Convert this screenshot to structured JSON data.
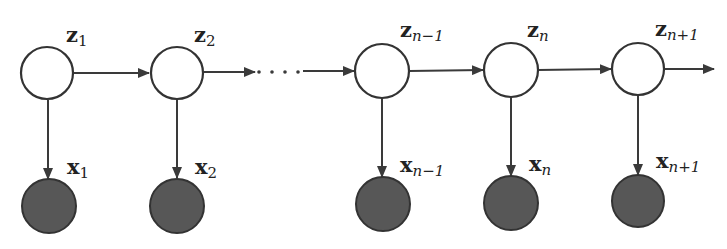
{
  "diagram": {
    "type": "hidden-markov-model",
    "colors": {
      "latent_fill": "#ffffff",
      "observed_fill": "#575757",
      "stroke": "#333333"
    },
    "latent_nodes": [
      {
        "id": "z1",
        "base": "z",
        "sub": "1",
        "cx": 47,
        "cy": 73
      },
      {
        "id": "z2",
        "base": "z",
        "sub": "2",
        "cx": 177,
        "cy": 73
      },
      {
        "id": "zn-1",
        "base": "z",
        "sub": "n−1",
        "cx": 382,
        "cy": 71
      },
      {
        "id": "zn",
        "base": "z",
        "sub": "n",
        "cx": 511,
        "cy": 70
      },
      {
        "id": "zn+1",
        "base": "z",
        "sub": "n+1",
        "cx": 638,
        "cy": 69
      }
    ],
    "observed_nodes": [
      {
        "id": "x1",
        "base": "x",
        "sub": "1",
        "cx": 49,
        "cy": 206
      },
      {
        "id": "x2",
        "base": "x",
        "sub": "2",
        "cx": 177,
        "cy": 206
      },
      {
        "id": "xn-1",
        "base": "x",
        "sub": "n−1",
        "cx": 383,
        "cy": 204
      },
      {
        "id": "xn",
        "base": "x",
        "sub": "n",
        "cx": 511,
        "cy": 203
      },
      {
        "id": "xn+1",
        "base": "x",
        "sub": "n+1",
        "cx": 638,
        "cy": 201
      }
    ],
    "edges": [
      {
        "from": "z1",
        "to": "z2"
      },
      {
        "from": "z2",
        "to": "ellipsis"
      },
      {
        "from": "ellipsis",
        "to": "zn-1"
      },
      {
        "from": "zn-1",
        "to": "zn"
      },
      {
        "from": "zn",
        "to": "zn+1"
      },
      {
        "from": "zn+1",
        "to": "continuation"
      },
      {
        "from": "z1",
        "to": "x1"
      },
      {
        "from": "z2",
        "to": "x2"
      },
      {
        "from": "zn-1",
        "to": "xn-1"
      },
      {
        "from": "zn",
        "to": "xn"
      },
      {
        "from": "zn+1",
        "to": "xn+1"
      }
    ],
    "ellipsis": "· · · ·",
    "labels": {
      "z1": {
        "main": "z",
        "sub": "1"
      },
      "z2": {
        "main": "z",
        "sub": "2"
      },
      "zn_minus_1": {
        "main": "z",
        "sub": "n−1"
      },
      "zn": {
        "main": "z",
        "sub": "n"
      },
      "zn_plus_1": {
        "main": "z",
        "sub": "n+1"
      },
      "x1": {
        "main": "x",
        "sub": "1"
      },
      "x2": {
        "main": "x",
        "sub": "2"
      },
      "xn_minus_1": {
        "main": "x",
        "sub": "n−1"
      },
      "xn": {
        "main": "x",
        "sub": "n"
      },
      "xn_plus_1": {
        "main": "x",
        "sub": "n+1"
      }
    }
  }
}
